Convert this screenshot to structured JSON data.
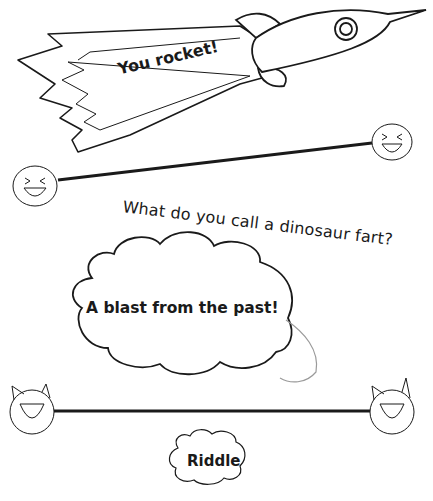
{
  "rocket": {
    "label": "You rocket!"
  },
  "riddle_card": {
    "question": "What do you call a dinosaur fart?",
    "answer": "A blast from the past!",
    "badge": "Riddle"
  },
  "decorations": {
    "top_connector": {
      "left_icon": "laughing-face-icon",
      "right_icon": "laughing-face-icon"
    },
    "bottom_connector": {
      "left_icon": "laughing-cat-icon",
      "right_icon": "laughing-cat-icon"
    }
  },
  "colors": {
    "ink": "#1a1a1a",
    "background": "#ffffff",
    "soft_ink": "#9a9a9a"
  }
}
